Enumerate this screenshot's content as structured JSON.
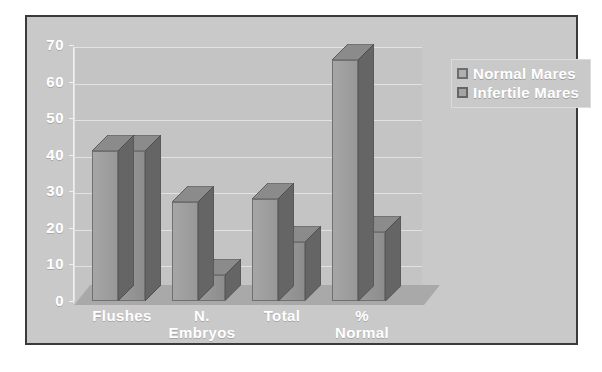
{
  "chart_data": {
    "type": "bar",
    "title": "",
    "xlabel": "",
    "ylabel": "",
    "ylim": [
      0,
      70
    ],
    "yticks": [
      0,
      10,
      20,
      30,
      40,
      50,
      60,
      70
    ],
    "ytick_labels": [
      "0",
      "10",
      "20",
      "30",
      "40",
      "50",
      "60",
      "70"
    ],
    "grid": true,
    "legend_position": "top-right",
    "style": "3d-column",
    "categories": [
      "Flushes",
      "N.\nEmbryos",
      "Total",
      "%\nNormal"
    ],
    "category_labels": [
      "Flushes",
      "N. Embryos",
      "Total",
      "% Normal"
    ],
    "series": [
      {
        "name": "Normal Mares",
        "values": [
          41,
          27,
          28,
          66
        ],
        "color": "#9e9e9e"
      },
      {
        "name": "Infertile Mares",
        "values": [
          41,
          7,
          16,
          19
        ],
        "color": "#939393"
      }
    ],
    "colors": {
      "plot_background": "#c4c4c4",
      "chart_background": "#c9c9c9",
      "frame_border": "#3a3a3a",
      "gridline": "#e2e2e2",
      "text": "#ffffff",
      "bar_side": "#6a6a6a",
      "bar_top": "#8e8e8e"
    }
  },
  "legend": {
    "items": [
      {
        "label": "Normal Mares"
      },
      {
        "label": "Infertile Mares"
      }
    ]
  }
}
